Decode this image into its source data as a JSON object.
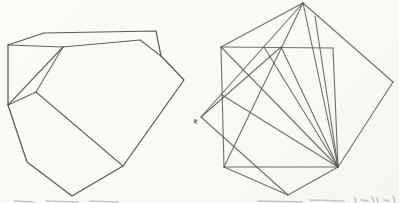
{
  "page": {
    "width": 399,
    "height": 203,
    "paper_color": "#fbfaf7",
    "ink_color_left": "#4f4b44",
    "ink_color_right": "#5b564f",
    "remnant_color": "#8d8a84"
  },
  "figures": {
    "left": {
      "label": "irregular non-convex polyhedron",
      "stroke_width": 1.25,
      "opacity": 0.92,
      "outline": [
        [
          8,
          45
        ],
        [
          44,
          33
        ],
        [
          156,
          31
        ],
        [
          161,
          56
        ],
        [
          184,
          80
        ],
        [
          123,
          166
        ],
        [
          72,
          196
        ],
        [
          27,
          162
        ],
        [
          8,
          105
        ]
      ],
      "interior_segments": [
        [
          [
            8,
            45
          ],
          [
            63,
            47
          ]
        ],
        [
          [
            63,
            47
          ],
          [
            140,
            40
          ]
        ],
        [
          [
            140,
            40
          ],
          [
            161,
            56
          ]
        ],
        [
          [
            63,
            47
          ],
          [
            36,
            92
          ]
        ],
        [
          [
            36,
            92
          ],
          [
            8,
            105
          ]
        ],
        [
          [
            63,
            47
          ],
          [
            8,
            105
          ]
        ],
        [
          [
            36,
            92
          ],
          [
            123,
            166
          ]
        ]
      ]
    },
    "right": {
      "label": "two overlapping squares with triangulating fan",
      "stroke_width": 1.1,
      "opacity": 0.85,
      "segments": [
        [
          [
            221,
            47
          ],
          [
            333,
            48
          ]
        ],
        [
          [
            333,
            48
          ],
          [
            338,
            167
          ]
        ],
        [
          [
            338,
            167
          ],
          [
            224,
            167
          ]
        ],
        [
          [
            224,
            167
          ],
          [
            221,
            47
          ]
        ],
        [
          [
            303,
            3
          ],
          [
            393,
            82
          ]
        ],
        [
          [
            393,
            82
          ],
          [
            338,
            167
          ]
        ],
        [
          [
            338,
            167
          ],
          [
            288,
            195
          ]
        ],
        [
          [
            288,
            195
          ],
          [
            201,
            117
          ]
        ],
        [
          [
            201,
            117
          ],
          [
            303,
            3
          ]
        ],
        [
          [
            303,
            3
          ],
          [
            224,
            167
          ]
        ],
        [
          [
            201,
            117
          ],
          [
            281,
            47
          ]
        ],
        [
          [
            224,
            167
          ],
          [
            288,
            195
          ]
        ],
        [
          [
            221,
            47
          ],
          [
            303,
            3
          ]
        ],
        [
          [
            338,
            167
          ],
          [
            221,
            47
          ]
        ],
        [
          [
            338,
            167
          ],
          [
            264,
            47
          ]
        ],
        [
          [
            338,
            167
          ],
          [
            281,
            47
          ]
        ],
        [
          [
            338,
            167
          ],
          [
            303,
            3
          ]
        ],
        [
          [
            338,
            167
          ],
          [
            315,
            16
          ]
        ],
        [
          [
            338,
            167
          ],
          [
            222,
            95
          ]
        ]
      ]
    }
  },
  "ink_speck": {
    "points": [
      [
        194,
        119
      ],
      [
        198,
        120
      ],
      [
        196,
        122
      ],
      [
        198,
        124
      ],
      [
        194,
        123
      ]
    ],
    "color": "#57534c",
    "opacity": 0.75
  },
  "caption_remnants": {
    "opacity": 0.45,
    "stroke_width": 1.6,
    "marks": [
      [
        [
          14,
          201
        ],
        [
          34,
          202
        ]
      ],
      [
        [
          46,
          201
        ],
        [
          78,
          202
        ]
      ],
      [
        [
          90,
          201
        ],
        [
          118,
          202
        ]
      ],
      [
        [
          258,
          201
        ],
        [
          302,
          202
        ]
      ],
      [
        [
          310,
          200
        ],
        [
          344,
          201
        ]
      ],
      [
        [
          355,
          198
        ],
        [
          356,
          202
        ]
      ],
      [
        [
          361,
          200
        ],
        [
          368,
          201
        ]
      ],
      [
        [
          372,
          197
        ],
        [
          374,
          202
        ]
      ],
      [
        [
          377,
          198
        ],
        [
          378,
          202
        ]
      ],
      [
        [
          384,
          200
        ],
        [
          389,
          201
        ]
      ],
      [
        [
          393,
          196
        ],
        [
          395,
          202
        ]
      ]
    ]
  }
}
